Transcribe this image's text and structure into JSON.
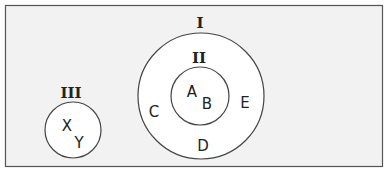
{
  "diagram": {
    "type": "nested-set-diagram",
    "frame": {
      "background": "#f2f2f2",
      "border": "#555555"
    },
    "circle_fill": "#ffffff",
    "circle_stroke": "#444444",
    "sets": [
      {
        "label": "I",
        "elements": [
          "C",
          "D",
          "E"
        ],
        "contains": "II"
      },
      {
        "label": "II",
        "elements": [
          "A",
          "B"
        ],
        "inside": "I"
      },
      {
        "label": "III",
        "elements": [
          "X",
          "Y"
        ]
      }
    ]
  },
  "labels": {
    "set_I": "I",
    "set_II": "II",
    "set_III": "III",
    "A": "A",
    "B": "B",
    "C": "C",
    "D": "D",
    "E": "E",
    "X": "X",
    "Y": "Y"
  }
}
